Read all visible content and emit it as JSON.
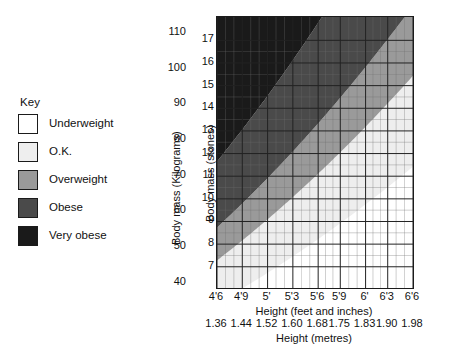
{
  "legend": {
    "title": "Key",
    "items": [
      {
        "label": "Underweight",
        "color": "#ffffff"
      },
      {
        "label": "O.K.",
        "color": "#eeeeee"
      },
      {
        "label": "Overweight",
        "color": "#9a9a9a"
      },
      {
        "label": "Obese",
        "color": "#4a4a4a"
      },
      {
        "label": "Very obese",
        "color": "#1a1a1a"
      }
    ]
  },
  "chart_data": {
    "type": "heatmap",
    "title": "",
    "xlabel": "Height (feet and inches)",
    "xlabel_secondary": "Height (metres)",
    "ylabel": "Body mass (Kilograms)",
    "ylabel_secondary": "Body mass (stones)",
    "grid": true,
    "legend_position": "left",
    "x": {
      "unit_primary": "feet and inches",
      "unit_secondary": "metres",
      "range_metres": [
        1.36,
        1.98
      ],
      "ticks_feet_inches": [
        "4'6",
        "4'9",
        "5'",
        "5'3",
        "5'6",
        "5'9",
        "6'",
        "6'3",
        "6'6"
      ],
      "ticks_metres": [
        "1.36",
        "1.44",
        "1.52",
        "1.60",
        "1.68",
        "1.75",
        "1.83",
        "1.90",
        "1.98"
      ],
      "ticks_metres_values": [
        1.36,
        1.44,
        1.52,
        1.6,
        1.68,
        1.75,
        1.83,
        1.9,
        1.98
      ],
      "minor_divisions_per_major": 3
    },
    "y": {
      "unit_primary": "Kilograms",
      "unit_secondary": "stones",
      "range_kg": [
        38.5,
        114.5
      ],
      "ticks_kg": [
        "40",
        "50",
        "60",
        "70",
        "80",
        "90",
        "100",
        "110"
      ],
      "ticks_kg_values": [
        40,
        50,
        60,
        70,
        80,
        90,
        100,
        110
      ],
      "ticks_stones": [
        "7",
        "8",
        "9",
        "10",
        "11",
        "12",
        "13",
        "14",
        "15",
        "16",
        "17"
      ],
      "ticks_stones_values": [
        7,
        8,
        9,
        10,
        11,
        12,
        13,
        14,
        15,
        16,
        17
      ],
      "kg_per_stone": 6.35029
    },
    "bands": [
      {
        "name": "Underweight",
        "bmi_min": 0,
        "bmi_max": 18.5,
        "color": "#ffffff"
      },
      {
        "name": "O.K.",
        "bmi_min": 18.5,
        "bmi_max": 25,
        "color": "#eeeeee"
      },
      {
        "name": "Overweight",
        "bmi_min": 25,
        "bmi_max": 30,
        "color": "#9a9a9a"
      },
      {
        "name": "Obese",
        "bmi_min": 30,
        "bmi_max": 40,
        "color": "#4a4a4a"
      },
      {
        "name": "Very obese",
        "bmi_min": 40,
        "bmi_max": 999,
        "color": "#1a1a1a"
      }
    ],
    "formula": "BMI = mass(kg) / height(m)^2"
  }
}
